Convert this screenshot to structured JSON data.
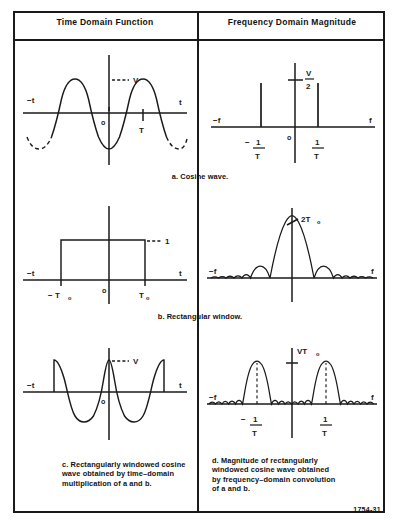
{
  "figure": {
    "number": "1754-31",
    "columns": [
      {
        "title": "Time Domain Function"
      },
      {
        "title": "Frequency Domain Magnitude"
      }
    ]
  },
  "rows": [
    {
      "id": "a",
      "caption": "a. Cosine wave.",
      "time_plot": {
        "axis_left_label": "−t",
        "axis_right_label": "t",
        "origin_label": "o",
        "amplitude_label": "V",
        "period_label": "T"
      },
      "freq_plot": {
        "axis_left_label": "−f",
        "axis_right_label": "f",
        "origin_label": "o",
        "amplitude_numerator": "V",
        "amplitude_denominator": "2",
        "left_impulse_label_sign": "−",
        "left_impulse_numerator": "1",
        "left_impulse_denominator": "T",
        "right_impulse_numerator": "1",
        "right_impulse_denominator": "T"
      }
    },
    {
      "id": "b",
      "caption": "b. Rectangular window.",
      "time_plot": {
        "axis_left_label": "−t",
        "axis_right_label": "t",
        "origin_label": "o",
        "amplitude_label": "1",
        "left_edge_label": "− T",
        "left_edge_subscript": "o",
        "right_edge_label": "T",
        "right_edge_subscript": "o"
      },
      "freq_plot": {
        "axis_left_label": "−f",
        "axis_right_label": "f",
        "peak_label": "2T",
        "peak_subscript": "o"
      }
    },
    {
      "id": "c",
      "caption_lines": [
        "c. Rectangularly windowed cosine",
        "wave obtained by time–domain",
        "multiplication of a and b."
      ],
      "time_plot": {
        "axis_left_label": "−t",
        "axis_right_label": "t",
        "origin_label": "o",
        "amplitude_label": "V"
      },
      "freq_plot": {
        "axis_left_label": "−f",
        "axis_right_label": "f",
        "peak_label": "VT",
        "peak_subscript": "o",
        "left_lobe_label_sign": "−",
        "left_lobe_numerator": "1",
        "left_lobe_denominator": "T",
        "right_lobe_numerator": "1",
        "right_lobe_denominator": "T"
      }
    }
  ],
  "row_d": {
    "id": "d",
    "caption_lines": [
      "d. Magnitude of rectangularly",
      "windowed cosine wave obtained",
      "by frequency–domain convolution",
      "of a and b."
    ]
  }
}
